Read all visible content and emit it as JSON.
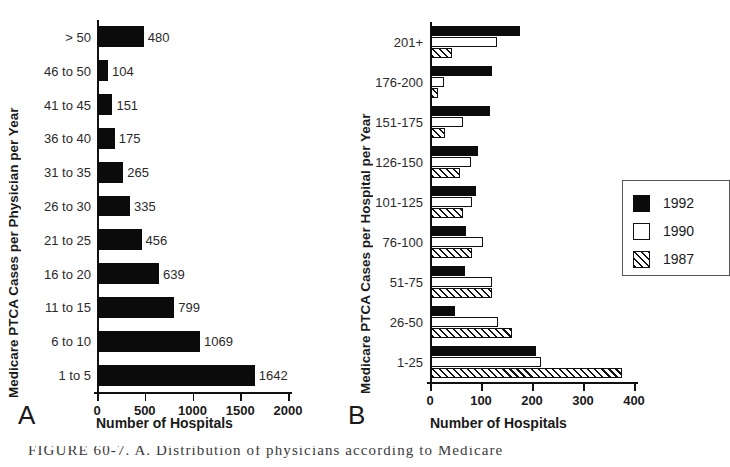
{
  "figure": {
    "caption": "FIGURE  60-7.   A. Distribution  of  physicians  according  to  Medicare"
  },
  "panelA": {
    "letter": "A",
    "ylabel": "Medicare PTCA Cases per Physician per Year",
    "xlabel": "Number of Hospitals",
    "chart_data": {
      "type": "bar",
      "orientation": "horizontal",
      "title": "",
      "xlabel": "Number of Hospitals",
      "ylabel": "Medicare PTCA Cases per Physician per Year",
      "xlim": [
        0,
        2000
      ],
      "xticks": [
        0,
        500,
        1000,
        1500,
        2000
      ],
      "grid": false,
      "categories": [
        "> 50",
        "46 to 50",
        "41 to 45",
        "36 to 40",
        "31 to 35",
        "26 to 30",
        "21 to 25",
        "16 to 20",
        "11 to 15",
        "6 to 10",
        "1 to 5"
      ],
      "values": [
        480,
        104,
        151,
        175,
        265,
        335,
        456,
        639,
        799,
        1069,
        1642
      ],
      "datalabels": [
        "480",
        "104",
        "151",
        "175",
        "265",
        "335",
        "456",
        "639",
        "799",
        "1069",
        "1642"
      ],
      "series_color": "#0b0b0b"
    }
  },
  "panelB": {
    "letter": "B",
    "ylabel": "Medicare PTCA Cases per Hospital per Year",
    "xlabel": "Number of Hospitals",
    "legend": {
      "position": "center-right",
      "entries": [
        {
          "label": "1992",
          "style": "solid-black",
          "color": "#0b0b0b"
        },
        {
          "label": "1990",
          "style": "open-white",
          "color": "#ffffff"
        },
        {
          "label": "1987",
          "style": "hatched",
          "color": "#ffffff"
        }
      ]
    },
    "chart_data": {
      "type": "bar",
      "orientation": "horizontal",
      "title": "",
      "xlabel": "Number of Hospitals",
      "ylabel": "Medicare PTCA Cases per Hospital per Year",
      "xlim": [
        0,
        400
      ],
      "xticks": [
        0,
        100,
        200,
        300,
        400
      ],
      "grid": false,
      "categories": [
        "201+",
        "176-200",
        "151-175",
        "126-150",
        "101-125",
        "76-100",
        "51-75",
        "26-50",
        "1-25"
      ],
      "series": [
        {
          "name": "1992",
          "values": [
            175,
            120,
            115,
            93,
            88,
            68,
            66,
            48,
            205
          ]
        },
        {
          "name": "1990",
          "values": [
            130,
            25,
            63,
            78,
            80,
            102,
            120,
            131,
            215
          ]
        },
        {
          "name": "1987",
          "values": [
            42,
            13,
            27,
            57,
            62,
            80,
            120,
            158,
            375
          ]
        }
      ]
    }
  }
}
